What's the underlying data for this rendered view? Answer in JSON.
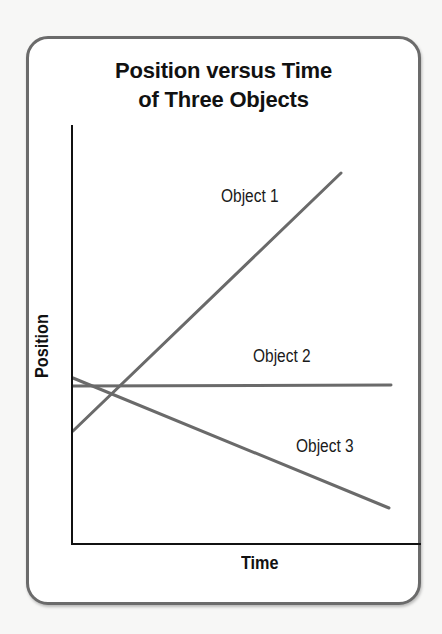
{
  "chart_data": {
    "type": "line",
    "title": "Position versus Time of Three Objects",
    "title_lines": [
      "Position versus Time",
      "of Three Objects"
    ],
    "xlabel": "Time",
    "ylabel": "Position",
    "grid": false,
    "ticks": false,
    "legend": "inline labels",
    "axis_range_px": {
      "x": [
        72,
        421
      ],
      "y": [
        544,
        125
      ]
    },
    "series": [
      {
        "name": "Object 1",
        "description": "starts low, increases steeply (positive slope)",
        "x": [
          0,
          0.77
        ],
        "y": [
          0.27,
          0.89
        ],
        "pixel_points": [
          [
            73,
            431
          ],
          [
            341,
            173
          ]
        ]
      },
      {
        "name": "Object 2",
        "description": "constant position (zero slope)",
        "x": [
          0,
          0.91
        ],
        "y": [
          0.38,
          0.38
        ],
        "pixel_points": [
          [
            73,
            386
          ],
          [
            391,
            385
          ]
        ]
      },
      {
        "name": "Object 3",
        "description": "starts highest, decreases (negative slope)",
        "x": [
          0,
          0.91
        ],
        "y": [
          0.4,
          0.09
        ],
        "pixel_points": [
          [
            73,
            378
          ],
          [
            389,
            508
          ]
        ]
      }
    ],
    "colors": {
      "lines": "#6a6a6a",
      "axes": "#111111",
      "card_border": "#6b6b6b"
    }
  },
  "labels": {
    "object1": "Object 1",
    "object2": "Object 2",
    "object3": "Object 3",
    "x_axis": "Time",
    "y_axis": "Position"
  }
}
